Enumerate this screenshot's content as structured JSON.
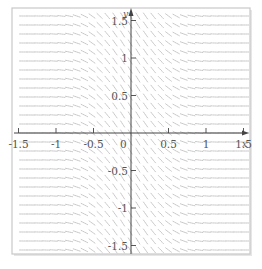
{
  "chart_data": {
    "type": "slope_field",
    "title": "",
    "xlabel": "x",
    "ylabel": "y",
    "xlim": [
      -1.6,
      1.6
    ],
    "ylim": [
      -1.6,
      1.6
    ],
    "x_ticks": [
      -1.5,
      -1,
      -0.5,
      0.5,
      1,
      1.5
    ],
    "x_tick_labels": [
      "-1.5",
      "-1",
      "-0.5",
      "0.5",
      "1",
      "1.5"
    ],
    "y_ticks": [
      1.5,
      1,
      0.5,
      -0.5,
      -1,
      -1.5
    ],
    "y_tick_labels": [
      "1.5",
      "1",
      "0.5",
      "-0.5",
      "-1",
      "-1.5"
    ],
    "origin_label": "0",
    "grid": false,
    "legend": null,
    "field_description": "Short gray line segments on a regular grid; slopes steeply negative near x = 0 and nearly horizontal for |x| large, same pattern in every row",
    "grid_spacing": 0.12,
    "slope_model": {
      "amplitude": -1.6,
      "decay": 3.0
    },
    "colors": {
      "segments": "#b9b9b9",
      "axes": "#444444",
      "frame": "#c8c8c8",
      "labels": "#555555"
    }
  },
  "layout": {
    "frame": {
      "left": 12,
      "top": 8,
      "right": 250,
      "bottom": 254
    },
    "origin_px": {
      "x": 131,
      "y": 133
    },
    "px_per_unit": 75
  }
}
